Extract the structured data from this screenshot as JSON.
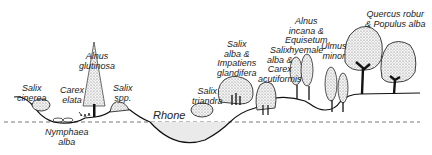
{
  "diagram": {
    "type": "vegetation-transect",
    "water_label": "Rhone",
    "colors": {
      "line": "#111111",
      "foliage": "#d8d8d8",
      "water": "#eaeaea",
      "dash": "#555555"
    },
    "labels": [
      {
        "id": "salix-cinerea",
        "text": "Salix\ncinerea"
      },
      {
        "id": "carex-elata",
        "text": "Carex\nelata"
      },
      {
        "id": "alnus-glutinosa",
        "text": "Alnus\nglutinosa"
      },
      {
        "id": "salix-spp",
        "text": "Salix\nspp."
      },
      {
        "id": "nymphaea-alba",
        "text": "Nymphaea\nalba"
      },
      {
        "id": "salix-triandra",
        "text": "Salix\ntriandra"
      },
      {
        "id": "salix-alba-impatiens",
        "text": "Salix\nalba &\nImpatiens\nglandifera"
      },
      {
        "id": "salix-alba-carex",
        "text": "Salix\nalba &\nCarex\nacutiformis"
      },
      {
        "id": "alnus-incana-equisetum",
        "text": "Alnus\nincana &\nEquisetum\nhyemale"
      },
      {
        "id": "ulmus-minor",
        "text": "Ulmus\nminor"
      },
      {
        "id": "quercus-populus",
        "text": "Quercus robur\n& Populus alba"
      }
    ]
  }
}
